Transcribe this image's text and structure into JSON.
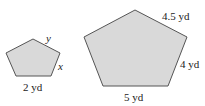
{
  "figure": {
    "small_pentagon": {
      "labels": {
        "top_right_side": "y",
        "right_side": "x",
        "bottom_side": "2 yd"
      }
    },
    "large_pentagon": {
      "labels": {
        "top_right_side": "4.5 yd",
        "right_side": "4 yd",
        "bottom_side": "5 yd"
      }
    },
    "colors": {
      "fill": "#d9d9d9",
      "stroke": "#555555",
      "background": "#ffffff"
    }
  }
}
